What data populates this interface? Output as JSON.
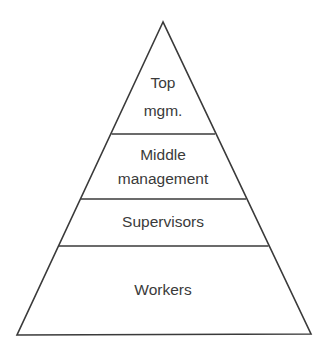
{
  "diagram": {
    "type": "pyramid",
    "levels": [
      {
        "lines": [
          "Top",
          "mgm."
        ]
      },
      {
        "lines": [
          "Middle",
          "management"
        ]
      },
      {
        "lines": [
          "Supervisors"
        ]
      },
      {
        "lines": [
          "Workers"
        ]
      }
    ],
    "colors": {
      "stroke": "#3a3a3a",
      "text": "#3a3a3a",
      "background": "#ffffff"
    }
  }
}
